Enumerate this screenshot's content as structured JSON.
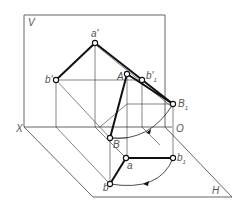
{
  "diagram": {
    "colors": {
      "background": "#ffffff",
      "line": "#111111",
      "plane": "#555555",
      "label": "#555555"
    },
    "planes": {
      "V": {
        "label": "V"
      },
      "H": {
        "label": "H"
      }
    },
    "axis": {
      "X": "X",
      "O": "O"
    },
    "labels": {
      "a_prime": "a'",
      "b_prime": "b'",
      "A": "A",
      "b1_prime_main": "b'",
      "b1_prime_sub": "1",
      "B1_main": "B",
      "B1_sub": "1",
      "B": "B",
      "a": "a",
      "b": "b",
      "b1_main": "b",
      "b1_sub": "1"
    }
  }
}
